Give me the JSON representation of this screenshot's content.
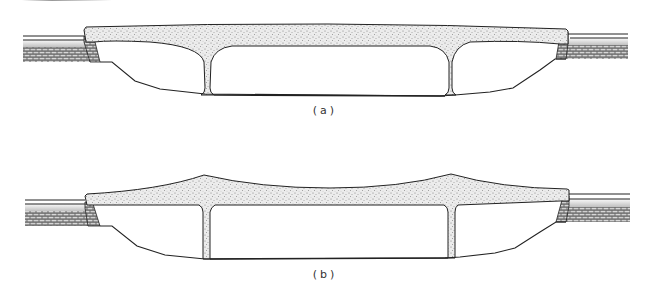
{
  "figure": {
    "type": "bridge-cross-section-comparison",
    "panels": [
      {
        "id": "a",
        "caption": "(a)",
        "description": "Flat-top deck slab with two tapered piers, sloped abutments on masonry"
      },
      {
        "id": "b",
        "caption": "(b)",
        "description": "Haunched deck slab peaking above piers, sloped abutments on masonry"
      }
    ]
  },
  "colors": {
    "line": "#222222",
    "concrete_fill": "#e9e9e9",
    "stipple": "#8a8a8a",
    "masonry": "#555555",
    "background": "#ffffff"
  }
}
